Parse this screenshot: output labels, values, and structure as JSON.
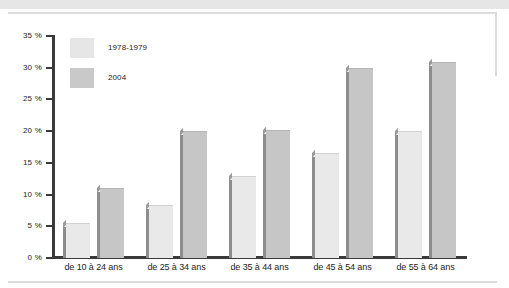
{
  "chart_data": {
    "type": "bar",
    "title": "",
    "xlabel": "",
    "ylabel": "",
    "ylim": [
      0,
      35
    ],
    "grid": false,
    "legend_position": "top-left",
    "categories": [
      "de 10 à 24 ans",
      "de 25 à 34 ans",
      "de 35 à 44 ans",
      "de 45 à 54 ans",
      "de 55 à 64 ans"
    ],
    "ytick_labels": [
      "0 %",
      "5 %",
      "10 %",
      "15 %",
      "20 %",
      "25 %",
      "30 %",
      "35 %"
    ],
    "ytick_values": [
      0,
      5,
      10,
      15,
      20,
      25,
      30,
      35
    ],
    "series": [
      {
        "name": "1978-1979",
        "color": "#e9e9e9",
        "values": [
          5.5,
          8.3,
          13.0,
          16.5,
          20.0
        ]
      },
      {
        "name": "2004",
        "color": "#c6c6c6",
        "values": [
          11.0,
          20.0,
          20.2,
          30.0,
          30.9
        ]
      }
    ]
  },
  "legend": {
    "items": [
      {
        "label": "1978-1979"
      },
      {
        "label": "2004"
      }
    ]
  },
  "axis": {
    "ticks": [
      {
        "label": "35 %",
        "value": 35
      },
      {
        "label": "30 %",
        "value": 30
      },
      {
        "label": "25 %",
        "value": 25
      },
      {
        "label": "20 %",
        "value": 20
      },
      {
        "label": "15 %",
        "value": 15
      },
      {
        "label": "10 %",
        "value": 10
      },
      {
        "label": "5 %",
        "value": 5
      },
      {
        "label": "0 %",
        "value": 0
      }
    ]
  }
}
